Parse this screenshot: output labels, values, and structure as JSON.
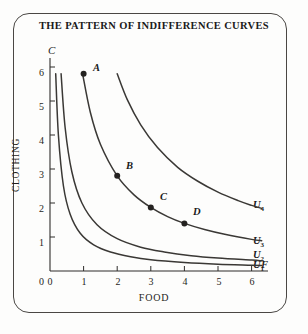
{
  "figure": {
    "title": "THE PATTERN OF INDIFFERENCE CURVES",
    "frame_color": "#4a4744",
    "background_color": "#fdfdfc",
    "curve_color": "#3a3835",
    "axis_color": "#2e2c2a"
  },
  "axes": {
    "x_axis_symbol": "F",
    "y_axis_symbol": "C",
    "x_label": "FOOD",
    "y_label": "CLOTHING",
    "x_ticks": [
      "0",
      "1",
      "2",
      "3",
      "4",
      "5",
      "6"
    ],
    "y_ticks": [
      "0",
      "1",
      "2",
      "3",
      "4",
      "5",
      "6"
    ]
  },
  "chart_data": {
    "type": "line",
    "title": "THE PATTERN OF INDIFFERENCE CURVES",
    "xlabel": "FOOD",
    "ylabel": "CLOTHING",
    "xlim": [
      0,
      6.4
    ],
    "ylim": [
      0,
      6.2
    ],
    "grid": false,
    "legend_position": "right-inline",
    "x_ticks": [
      0,
      1,
      2,
      3,
      4,
      5,
      6
    ],
    "y_ticks": [
      0,
      1,
      2,
      3,
      4,
      5,
      6
    ],
    "series": [
      {
        "name": "U1",
        "label": "U",
        "subscript": "1",
        "description": "lowest indifference curve, rectangular hyperbola k = 1.0",
        "k": 1.0,
        "x": [
          0.17,
          0.25,
          0.4,
          0.6,
          0.9,
          1.3,
          1.8,
          2.4,
          3.0,
          4.0,
          5.0,
          6.0,
          6.3
        ],
        "y": [
          5.8,
          4.0,
          2.5,
          1.67,
          1.11,
          0.77,
          0.56,
          0.42,
          0.33,
          0.25,
          0.2,
          0.17,
          0.16
        ]
      },
      {
        "name": "U2",
        "label": "U",
        "subscript": "2",
        "description": "second indifference curve, rectangular hyperbola k = 1.9",
        "k": 1.9,
        "x": [
          0.33,
          0.45,
          0.65,
          0.95,
          1.4,
          2.0,
          2.7,
          3.4,
          4.2,
          5.0,
          6.0,
          6.3
        ],
        "y": [
          5.8,
          4.22,
          2.92,
          2.0,
          1.36,
          0.95,
          0.7,
          0.56,
          0.45,
          0.38,
          0.32,
          0.3
        ]
      },
      {
        "name": "U3",
        "label": "U",
        "subscript": "3",
        "description": "third indifference curve through points B, C and D; rectangular hyperbola k = 5.6",
        "k": 5.6,
        "x": [
          0.97,
          1.2,
          1.5,
          2.0,
          2.5,
          3.0,
          3.5,
          4.0,
          4.6,
          5.2,
          6.0,
          6.3
        ],
        "y": [
          5.8,
          4.67,
          3.73,
          2.8,
          2.24,
          1.87,
          1.6,
          1.4,
          1.22,
          1.08,
          0.93,
          0.89
        ]
      },
      {
        "name": "U4",
        "label": "U",
        "subscript": "4",
        "description": "highest indifference curve, rectangular hyperbola k = 11.6",
        "k": 11.6,
        "x": [
          2.0,
          2.3,
          2.7,
          3.2,
          3.8,
          4.4,
          5.0,
          5.6,
          6.0,
          6.3
        ],
        "y": [
          5.8,
          5.04,
          4.3,
          3.63,
          3.05,
          2.64,
          2.32,
          2.07,
          1.93,
          1.84
        ]
      }
    ],
    "points": [
      {
        "label": "A",
        "x": 1.0,
        "y": 5.8,
        "on_curve": "none"
      },
      {
        "label": "B",
        "x": 2.0,
        "y": 2.8,
        "on_curve": "U3"
      },
      {
        "label": "C",
        "x": 3.0,
        "y": 1.87,
        "on_curve": "U3"
      },
      {
        "label": "D",
        "x": 4.0,
        "y": 1.4,
        "on_curve": "U3"
      }
    ]
  }
}
